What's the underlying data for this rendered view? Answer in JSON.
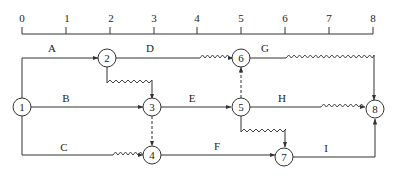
{
  "diagram": {
    "type": "time-scaled network (double-code) diagram",
    "timeline": {
      "ticks": [
        "0",
        "1",
        "2",
        "3",
        "4",
        "5",
        "6",
        "7",
        "8"
      ]
    },
    "nodes": [
      {
        "id": "1",
        "label": "1"
      },
      {
        "id": "2",
        "label": "2"
      },
      {
        "id": "3",
        "label": "3"
      },
      {
        "id": "4",
        "label": "4"
      },
      {
        "id": "5",
        "label": "5"
      },
      {
        "id": "6",
        "label": "6"
      },
      {
        "id": "7",
        "label": "7"
      },
      {
        "id": "8",
        "label": "8"
      }
    ],
    "activities": [
      {
        "label": "A",
        "from": "1",
        "to": "2",
        "duration": 2,
        "free_float": 0
      },
      {
        "label": "B",
        "from": "1",
        "to": "3",
        "duration": 3,
        "free_float": 0
      },
      {
        "label": "C",
        "from": "1",
        "to": "4",
        "duration": 2,
        "free_float": 1
      },
      {
        "label": "D",
        "from": "2",
        "to": "6",
        "duration": 2,
        "free_float": 1
      },
      {
        "label": "E",
        "from": "3",
        "to": "5",
        "duration": 2,
        "free_float": 0
      },
      {
        "label": "F",
        "from": "4",
        "to": "7",
        "duration": 3,
        "free_float": 0
      },
      {
        "label": "G",
        "from": "6",
        "to": "8",
        "duration": 1,
        "free_float": 2
      },
      {
        "label": "H",
        "from": "5",
        "to": "8",
        "duration": 2,
        "free_float": 1
      },
      {
        "label": "I",
        "from": "7",
        "to": "8",
        "duration": 2,
        "free_float": 0
      }
    ],
    "dummy_activities": [
      {
        "from": "2",
        "to": "3",
        "style": "wavy",
        "float": 1
      },
      {
        "from": "3",
        "to": "4",
        "style": "dashed"
      },
      {
        "from": "5",
        "to": "6",
        "style": "dashed"
      },
      {
        "from": "5",
        "to": "7",
        "style": "wavy",
        "float": 2
      }
    ]
  }
}
